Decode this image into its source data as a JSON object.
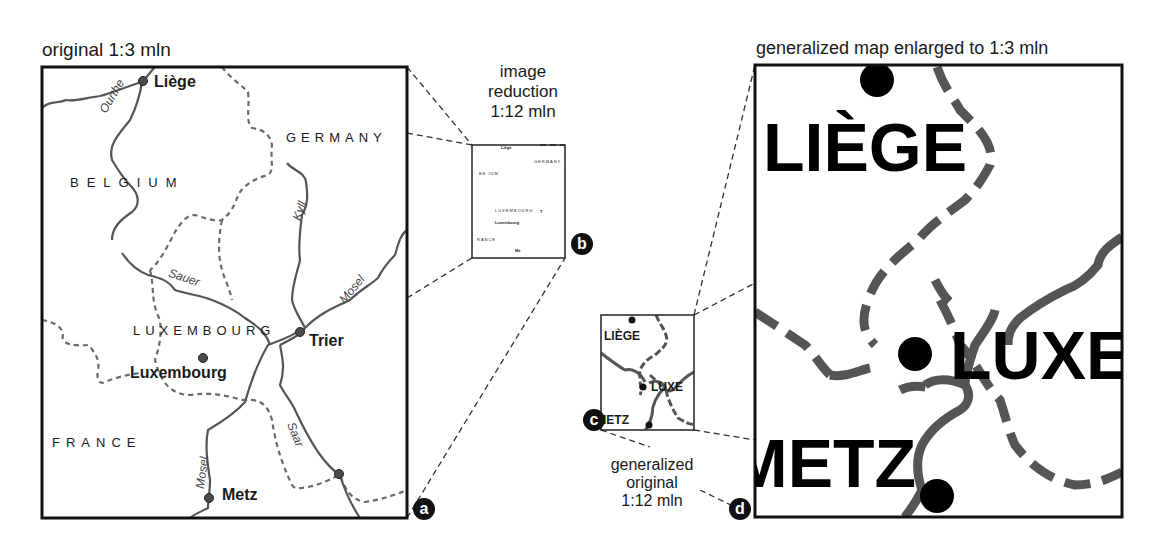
{
  "captions": {
    "original": "original 1:3 mln",
    "reduction": [
      "image",
      "reduction",
      "1:12 mln"
    ],
    "generalized_original": [
      "generalized",
      "original",
      "1:12 mln"
    ],
    "enlarged": "generalized map enlarged to 1:3 mln"
  },
  "markers": {
    "a": "a",
    "b": "b",
    "c": "c",
    "d": "d"
  },
  "original_map": {
    "countries": {
      "germany": "GERMANY",
      "belgium": "BELGIUM",
      "luxembourg": "LUXEMBOURG",
      "france": "FRANCE"
    },
    "cities": {
      "liege": "Liège",
      "trier": "Trier",
      "luxembourg": "Luxembourg",
      "metz": "Metz"
    },
    "rivers": {
      "ourthe": "Ourthe",
      "kyll": "Kyll",
      "sauer": "Sauer",
      "mosel_north": "Mosel",
      "saar": "Saar",
      "mosel_south": "Mosel"
    }
  },
  "reduced_map": {
    "labels": {
      "liege": "Liège",
      "germany": "GERMANY",
      "belgium": "BE   IUM",
      "luxembourg": "LUXEMBOURG",
      "trier": "T",
      "luxembourg_city": "Luxembourg",
      "france": "RANCE",
      "metz": "Me"
    }
  },
  "generalized_small": {
    "labels": {
      "liege": "LIÈGE",
      "luxe": "LUXE",
      "metz": "IETZ"
    }
  },
  "generalized_large": {
    "labels": {
      "liege": "LIÈGE",
      "luxe": "LUXE",
      "metz": "METZ"
    }
  },
  "colors": {
    "frame": "#111111",
    "river": "#555555",
    "border": "#666666",
    "city": "#444444",
    "general_line": "#555555",
    "marker": "#111111"
  }
}
